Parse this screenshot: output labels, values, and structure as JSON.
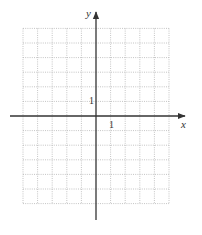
{
  "diagram": {
    "type": "coordinate-grid",
    "axes": {
      "x_label": "x",
      "y_label": "y"
    },
    "tick_labels": {
      "x_unit": "1",
      "y_unit": "1"
    },
    "grid": {
      "x_min": -5,
      "x_max": 5,
      "y_min": -6,
      "y_max": 6,
      "line_style": "dotted"
    },
    "colors": {
      "axis": "#333333",
      "grid": "#b5b5b5"
    }
  }
}
